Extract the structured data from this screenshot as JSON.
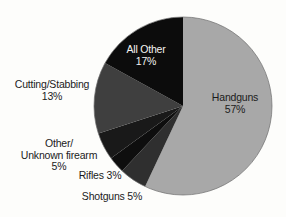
{
  "chart_data": {
    "type": "pie",
    "title": "",
    "start_angle_deg": 0,
    "direction": "clockwise",
    "legend_position": "none",
    "labels_layout": "around-pie",
    "total": 100,
    "slices": [
      {
        "name": "handguns",
        "label": "Handguns",
        "pct_label": "57%",
        "value": 57,
        "color": "#a8a8a8"
      },
      {
        "name": "shotguns",
        "label": "Shotguns",
        "pct_label": "5%",
        "value": 5,
        "color": "#2f2f2f"
      },
      {
        "name": "rifles",
        "label": "Rifles",
        "pct_label": "3%",
        "value": 3,
        "color": "#0e0e0e"
      },
      {
        "name": "other-unknown-firearm",
        "label": "Other/Unknown firearm",
        "label_lines": [
          "Other/",
          "Unknown firearm"
        ],
        "pct_label": "5%",
        "value": 5,
        "color": "#191919"
      },
      {
        "name": "cutting-stabbing",
        "label": "Cutting/Stabbing",
        "pct_label": "13%",
        "value": 13,
        "color": "#3f3f3f"
      },
      {
        "name": "all-other",
        "label": "All Other",
        "pct_label": "17%",
        "value": 17,
        "color": "#0c0c0c",
        "label_color": "#f4f4f2"
      }
    ]
  },
  "colors": {
    "background": "#fdfdfb",
    "text": "#1b1b1b",
    "pie_outline": "#6f6f6f",
    "handguns_fill": "#a8a8a8",
    "cutting_stabbing_fill": "#3f3f3f",
    "shotguns_fill": "#2f2f2f",
    "black_fill": "#0c0c0c"
  }
}
